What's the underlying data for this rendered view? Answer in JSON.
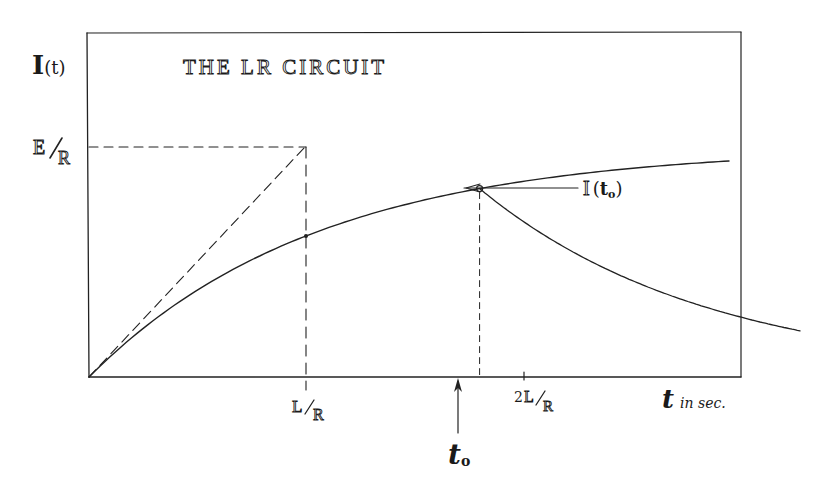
{
  "title": "THE LR CIRCUIT",
  "y_axis_label": {
    "main": "I",
    "arg": "(t)"
  },
  "x_axis_label": {
    "main": "t",
    "suffix": "in sec."
  },
  "level_label": {
    "num": "E",
    "den": "R"
  },
  "x_ticks": [
    {
      "id": "tau",
      "prefix": "",
      "num": "L",
      "den": "R",
      "value_tau": 1
    },
    {
      "id": "two-tau",
      "prefix": "2",
      "num": "L",
      "den": "R",
      "value_tau": 2
    }
  ],
  "switch_time": {
    "label_main": "t",
    "label_sub": "o",
    "value_tau": 1.8
  },
  "current_at_switch_label": {
    "main": "I",
    "arg_open": "(",
    "arg_main": "t",
    "arg_sub": "o",
    "arg_close": ")"
  },
  "model": {
    "growth": "I(t) = (E/R)(1 - e^(-t/τ)), τ = L/R",
    "decay": "I(t) = I(t_o) e^(-(t - t_o)/τ) for t > t_o",
    "tangent_at_origin": "slope E/L, reaches E/R at t = L/R"
  },
  "axes": {
    "t_range_tau": [
      0,
      4.3
    ],
    "I_range_E_over_R": [
      0,
      1.0
    ]
  },
  "colors": {
    "ink": "#222222",
    "paper": "#ffffff"
  }
}
